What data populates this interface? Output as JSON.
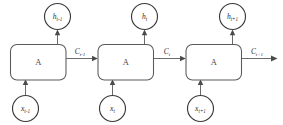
{
  "diagram": {
    "type": "diagram",
    "stroke_color": "#6b6b6b",
    "cell_stroke_color": "#5a5a5a",
    "circle_stroke_color": "#3a3a3a",
    "label_color": "#2e2e2e",
    "background_color": "#ffffff",
    "cells": [
      {
        "label": "A",
        "hidden_state": {
          "base": "h",
          "sub": "t-1"
        },
        "input": {
          "base": "x",
          "sub": "t-1"
        },
        "cell_state_out": {
          "base": "C",
          "sub": "t-1"
        }
      },
      {
        "label": "A",
        "hidden_state": {
          "base": "h",
          "sub": "t"
        },
        "input": {
          "base": "x",
          "sub": "t"
        },
        "cell_state_out": {
          "base": "C",
          "sub": "t"
        }
      },
      {
        "label": "A",
        "hidden_state": {
          "base": "h",
          "sub": "t+1"
        },
        "input": {
          "base": "x",
          "sub": "t+1"
        },
        "cell_state_out": {
          "base": "C",
          "sub": "t+1"
        }
      }
    ]
  }
}
